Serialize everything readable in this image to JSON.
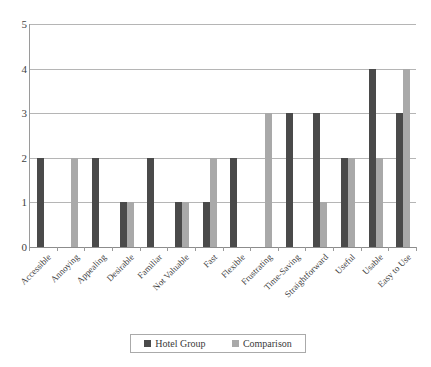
{
  "chart_data": {
    "type": "bar",
    "title": "",
    "subtitle": "",
    "xlabel": "",
    "ylabel": "",
    "ylim": [
      0,
      5
    ],
    "yticks": [
      0,
      1,
      2,
      3,
      4,
      5
    ],
    "ytick_labels": [
      "0",
      "1",
      "2",
      "3",
      "4",
      "5"
    ],
    "grid": true,
    "grid_axis": "y",
    "legend_position": "bottom",
    "categories": [
      "Accessible",
      "Annoying",
      "Appealing",
      "Desirable",
      "Familiar",
      "Not Valuable",
      "Fast",
      "Flexible",
      "Frustrating",
      "Time-Saving",
      "Straightforward",
      "Useful",
      "Usable",
      "Easy to Use"
    ],
    "series": [
      {
        "name": "Hotel Group",
        "color": "#4a4a4a",
        "values": [
          2,
          0,
          2,
          1,
          2,
          1,
          1,
          2,
          0,
          3,
          3,
          2,
          4,
          3
        ]
      },
      {
        "name": "Comparison",
        "color": "#a9a9a9",
        "values": [
          0,
          2,
          0,
          1,
          0,
          1,
          2,
          0,
          3,
          0,
          1,
          2,
          2,
          4
        ]
      }
    ]
  },
  "legend": {
    "entries": [
      {
        "label": "Hotel Group"
      },
      {
        "label": "Comparison"
      }
    ]
  }
}
